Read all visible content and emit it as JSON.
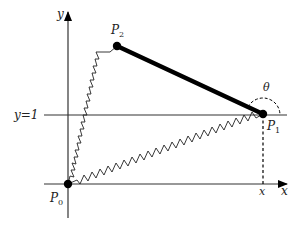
{
  "diagram": {
    "axes": {
      "x_label": "x",
      "y_label": "y"
    },
    "reference_line": {
      "label": "y=1"
    },
    "points": [
      {
        "name": "P",
        "sub": "0"
      },
      {
        "name": "P",
        "sub": "1"
      },
      {
        "name": "P",
        "sub": "2"
      }
    ],
    "angle_label": "θ",
    "projection_label": "x",
    "colors": {
      "line": "#000000",
      "axis": "#333333",
      "background": "#ffffff"
    }
  }
}
